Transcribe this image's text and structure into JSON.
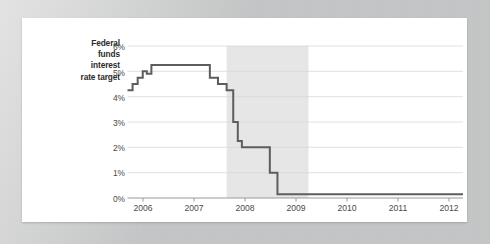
{
  "card": {
    "background_color": "#ffffff",
    "mount_color": "#cdced0"
  },
  "chart_data": {
    "type": "line",
    "title": "",
    "subtitle": "",
    "ylabel": "Federal funds interest rate target",
    "ylabel_lines": [
      "Federal",
      "funds",
      "interest",
      "rate target"
    ],
    "xlabel": "",
    "xlim": [
      2006.0,
      2012.6
    ],
    "ylim": [
      0,
      6
    ],
    "ytick_labels": [
      "0%",
      "1%",
      "2%",
      "3%",
      "4%",
      "5%",
      "6%"
    ],
    "ytick_values": [
      0,
      1,
      2,
      3,
      4,
      5,
      6
    ],
    "xtick_labels": [
      "2006",
      "2007",
      "2008",
      "2009",
      "2010",
      "2011",
      "2012"
    ],
    "xtick_values": [
      2006,
      2007,
      2008,
      2009,
      2010,
      2011,
      2012
    ],
    "grid": "horizontal",
    "legend": "none",
    "series": [
      {
        "name": "Federal funds interest rate target",
        "color": "#5d5d5d",
        "line_width": 2,
        "step": true,
        "x": [
          2006.0,
          2006.1,
          2006.1,
          2006.2,
          2006.2,
          2006.3,
          2006.3,
          2006.38,
          2006.38,
          2006.47,
          2006.47,
          2007.62,
          2007.62,
          2007.78,
          2007.78,
          2007.95,
          2007.95,
          2008.08,
          2008.08,
          2008.17,
          2008.17,
          2008.25,
          2008.25,
          2008.4,
          2008.4,
          2008.62,
          2008.62,
          2008.8,
          2008.8,
          2008.95,
          2008.95,
          2012.6
        ],
        "y": [
          4.25,
          4.25,
          4.5,
          4.5,
          4.75,
          4.75,
          5.0,
          5.0,
          4.9,
          4.9,
          5.25,
          5.25,
          4.75,
          4.75,
          4.5,
          4.5,
          4.25,
          4.25,
          3.0,
          3.0,
          2.25,
          2.25,
          2.0,
          2.0,
          2.0,
          2.0,
          2.0,
          2.0,
          1.0,
          1.0,
          0.15,
          0.15
        ],
        "key_points": [
          {
            "date": "2006 Q1",
            "value": 4.25
          },
          {
            "date": "2006 Q2",
            "value": 5.0
          },
          {
            "date": "2006 mid",
            "value": 5.25
          },
          {
            "date": "2007 Q3",
            "value": 5.25
          },
          {
            "date": "2007 Q4",
            "value": 4.5
          },
          {
            "date": "2008 Q1",
            "value": 3.0
          },
          {
            "date": "2008 Q2",
            "value": 2.0
          },
          {
            "date": "2008 Q4",
            "value": 1.0
          },
          {
            "date": "2009 onward",
            "value": 0.15
          }
        ]
      }
    ],
    "shaded_regions": [
      {
        "label": "Great Recession",
        "label_lines": [
          "Great",
          "Recession"
        ],
        "x_start": 2007.95,
        "x_end": 2009.56,
        "color": "#e6e6e6"
      }
    ]
  }
}
